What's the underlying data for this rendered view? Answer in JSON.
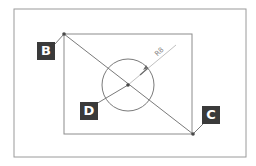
{
  "diagram": {
    "type": "technical-drawing",
    "colors": {
      "line": "#8c8c8c",
      "frame": "#9a9a9a",
      "label_bg": "#3a3a3a",
      "label_text": "#ffffff",
      "dim_line": "#b5b5b5",
      "dim_text": "#8a8a8a",
      "point": "#4a4a4a"
    },
    "outer_frame": {
      "x": 14,
      "y": 9,
      "w": 232,
      "h": 148
    },
    "inner_rect": {
      "x": 64,
      "y": 34,
      "w": 128,
      "h": 100
    },
    "circle": {
      "cx": 128,
      "cy": 85,
      "r": 26
    },
    "points": [
      {
        "id": "B",
        "label": "B",
        "x": 64,
        "y": 34
      },
      {
        "id": "C",
        "label": "C",
        "x": 193,
        "y": 134
      },
      {
        "id": "D",
        "label": "D",
        "x": 128,
        "y": 85
      }
    ],
    "labels": {
      "B": "B",
      "C": "C",
      "D": "D"
    },
    "dimension": {
      "text": "R8",
      "kind": "radius"
    }
  }
}
